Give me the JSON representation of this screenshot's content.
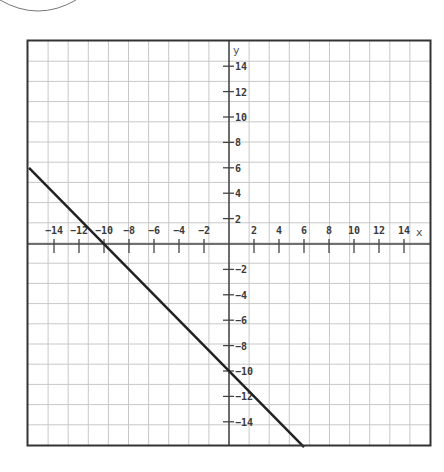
{
  "chart_data": {
    "type": "line",
    "title": "",
    "xlabel": "x",
    "ylabel": "y",
    "xlim": [
      -16,
      16
    ],
    "ylim": [
      -16,
      16
    ],
    "grid": true,
    "legend": null,
    "x_ticks": [
      -14,
      -12,
      -10,
      -8,
      -6,
      -4,
      -2,
      2,
      4,
      6,
      8,
      10,
      12,
      14
    ],
    "y_ticks": [
      -14,
      -12,
      -10,
      -8,
      -6,
      -4,
      -2,
      2,
      4,
      6,
      8,
      10,
      12,
      14
    ],
    "x_tick_labels": [
      "-14",
      "-12",
      "-10",
      "-8",
      "-6",
      "-4",
      "-2",
      "2",
      "4",
      "6",
      "8",
      "10",
      "12",
      "14"
    ],
    "y_tick_labels": [
      "-14",
      "-12",
      "-10",
      "-8",
      "-6",
      "-4",
      "-2",
      "2",
      "4",
      "6",
      "8",
      "10",
      "12",
      "14"
    ],
    "series": [
      {
        "name": "y = -x - 10",
        "equation": "y = -x - 10",
        "slope": -1,
        "intercept": -10,
        "x": [
          -16,
          6
        ],
        "y": [
          6,
          -16
        ],
        "color": "#222222"
      }
    ]
  },
  "colors": {
    "frame": "#333333",
    "grid": "#c8c8c8",
    "axis": "#444444",
    "line": "#222222",
    "labels": "#3a3a3a"
  }
}
